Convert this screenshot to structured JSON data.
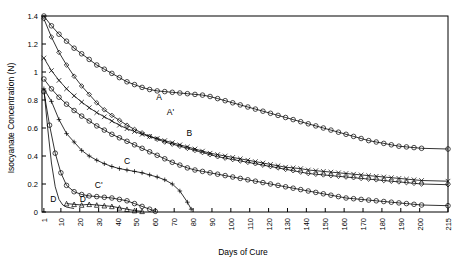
{
  "chart_data": {
    "type": "line",
    "title": "",
    "xlabel": "Days of Cure",
    "ylabel": "Isocyanate Concentration (N)",
    "xlim": [
      0,
      215
    ],
    "ylim": [
      0,
      1.4
    ],
    "grid": false,
    "legend_position": "inline-annotations",
    "x_ticks": [
      "1",
      "10",
      "20",
      "30",
      "40",
      "50",
      "60",
      "70",
      "80",
      "90",
      "100",
      "110",
      "120",
      "130",
      "140",
      "150",
      "160",
      "170",
      "180",
      "190",
      "200",
      "215"
    ],
    "y_ticks": [
      "0",
      "0.2",
      "0.4",
      "0.6",
      "0.8",
      "1",
      "1.2",
      "1.4"
    ],
    "annotations": [
      {
        "text": "A",
        "x": 62,
        "y": 0.8
      },
      {
        "text": "A'",
        "x": 68,
        "y": 0.695
      },
      {
        "text": "B",
        "x": 78,
        "y": 0.545
      },
      {
        "text": "C",
        "x": 45,
        "y": 0.345
      },
      {
        "text": "C'",
        "x": 30,
        "y": 0.175
      },
      {
        "text": "D",
        "x": 6,
        "y": 0.075
      },
      {
        "text": "D'",
        "x": 22,
        "y": 0.075
      }
    ],
    "series": [
      {
        "name": "A",
        "marker": "circle-open",
        "points": [
          [
            1,
            1.4
          ],
          [
            5,
            1.33
          ],
          [
            9,
            1.27
          ],
          [
            13,
            1.22
          ],
          [
            17,
            1.17
          ],
          [
            21,
            1.13
          ],
          [
            25,
            1.09
          ],
          [
            29,
            1.05
          ],
          [
            33,
            1.02
          ],
          [
            37,
            0.99
          ],
          [
            41,
            0.96
          ],
          [
            45,
            0.93
          ],
          [
            49,
            0.91
          ],
          [
            53,
            0.89
          ],
          [
            57,
            0.875
          ],
          [
            61,
            0.865
          ],
          [
            65,
            0.86
          ],
          [
            69,
            0.855
          ],
          [
            73,
            0.85
          ],
          [
            77,
            0.845
          ],
          [
            81,
            0.84
          ],
          [
            85,
            0.835
          ],
          [
            89,
            0.825
          ],
          [
            93,
            0.81
          ],
          [
            97,
            0.795
          ],
          [
            101,
            0.78
          ],
          [
            105,
            0.765
          ],
          [
            109,
            0.75
          ],
          [
            113,
            0.735
          ],
          [
            117,
            0.72
          ],
          [
            121,
            0.705
          ],
          [
            125,
            0.69
          ],
          [
            129,
            0.675
          ],
          [
            133,
            0.66
          ],
          [
            137,
            0.645
          ],
          [
            141,
            0.63
          ],
          [
            145,
            0.615
          ],
          [
            149,
            0.6
          ],
          [
            153,
            0.585
          ],
          [
            157,
            0.57
          ],
          [
            161,
            0.555
          ],
          [
            165,
            0.54
          ],
          [
            169,
            0.525
          ],
          [
            173,
            0.51
          ],
          [
            177,
            0.5
          ],
          [
            181,
            0.49
          ],
          [
            185,
            0.48
          ],
          [
            189,
            0.47
          ],
          [
            193,
            0.465
          ],
          [
            197,
            0.46
          ],
          [
            201,
            0.455
          ],
          [
            215,
            0.45
          ]
        ]
      },
      {
        "name": "A'",
        "marker": "diamond-open",
        "points": [
          [
            1,
            1.38
          ],
          [
            5,
            1.25
          ],
          [
            9,
            1.14
          ],
          [
            13,
            1.05
          ],
          [
            17,
            0.97
          ],
          [
            21,
            0.9
          ],
          [
            25,
            0.84
          ],
          [
            29,
            0.78
          ],
          [
            33,
            0.73
          ],
          [
            37,
            0.69
          ],
          [
            41,
            0.655
          ],
          [
            45,
            0.62
          ],
          [
            49,
            0.59
          ],
          [
            53,
            0.565
          ],
          [
            57,
            0.54
          ],
          [
            61,
            0.52
          ],
          [
            65,
            0.5
          ],
          [
            69,
            0.485
          ],
          [
            73,
            0.47
          ],
          [
            77,
            0.455
          ],
          [
            81,
            0.44
          ],
          [
            85,
            0.425
          ],
          [
            89,
            0.41
          ],
          [
            93,
            0.395
          ],
          [
            97,
            0.385
          ],
          [
            101,
            0.375
          ],
          [
            105,
            0.365
          ],
          [
            109,
            0.355
          ],
          [
            113,
            0.345
          ],
          [
            117,
            0.335
          ],
          [
            121,
            0.325
          ],
          [
            125,
            0.315
          ],
          [
            129,
            0.305
          ],
          [
            133,
            0.295
          ],
          [
            137,
            0.285
          ],
          [
            141,
            0.275
          ],
          [
            145,
            0.27
          ],
          [
            149,
            0.265
          ],
          [
            153,
            0.26
          ],
          [
            157,
            0.255
          ],
          [
            161,
            0.25
          ],
          [
            165,
            0.245
          ],
          [
            169,
            0.24
          ],
          [
            173,
            0.235
          ],
          [
            177,
            0.23
          ],
          [
            181,
            0.225
          ],
          [
            185,
            0.22
          ],
          [
            189,
            0.215
          ],
          [
            193,
            0.21
          ],
          [
            197,
            0.205
          ],
          [
            201,
            0.2
          ],
          [
            215,
            0.195
          ]
        ]
      },
      {
        "name": "B",
        "marker": "cross",
        "points": [
          [
            1,
            1.1
          ],
          [
            5,
            1.01
          ],
          [
            9,
            0.94
          ],
          [
            13,
            0.88
          ],
          [
            17,
            0.83
          ],
          [
            21,
            0.785
          ],
          [
            25,
            0.745
          ],
          [
            29,
            0.71
          ],
          [
            33,
            0.68
          ],
          [
            37,
            0.65
          ],
          [
            41,
            0.62
          ],
          [
            45,
            0.595
          ],
          [
            49,
            0.575
          ],
          [
            53,
            0.555
          ],
          [
            57,
            0.54
          ],
          [
            61,
            0.525
          ],
          [
            65,
            0.51
          ],
          [
            69,
            0.495
          ],
          [
            73,
            0.48
          ],
          [
            77,
            0.465
          ],
          [
            81,
            0.45
          ],
          [
            85,
            0.435
          ],
          [
            89,
            0.42
          ],
          [
            93,
            0.41
          ],
          [
            97,
            0.4
          ],
          [
            101,
            0.39
          ],
          [
            105,
            0.38
          ],
          [
            109,
            0.37
          ],
          [
            113,
            0.36
          ],
          [
            117,
            0.35
          ],
          [
            121,
            0.34
          ],
          [
            125,
            0.33
          ],
          [
            129,
            0.32
          ],
          [
            133,
            0.315
          ],
          [
            137,
            0.31
          ],
          [
            141,
            0.3
          ],
          [
            145,
            0.295
          ],
          [
            149,
            0.29
          ],
          [
            153,
            0.285
          ],
          [
            157,
            0.28
          ],
          [
            161,
            0.275
          ],
          [
            165,
            0.27
          ],
          [
            169,
            0.265
          ],
          [
            173,
            0.26
          ],
          [
            177,
            0.255
          ],
          [
            181,
            0.25
          ],
          [
            185,
            0.245
          ],
          [
            189,
            0.24
          ],
          [
            193,
            0.235
          ],
          [
            197,
            0.23
          ],
          [
            201,
            0.225
          ],
          [
            215,
            0.22
          ]
        ]
      },
      {
        "name": "B2",
        "marker": "circle-open",
        "points": [
          [
            1,
            0.95
          ],
          [
            5,
            0.88
          ],
          [
            9,
            0.82
          ],
          [
            13,
            0.77
          ],
          [
            17,
            0.725
          ],
          [
            21,
            0.685
          ],
          [
            25,
            0.65
          ],
          [
            29,
            0.615
          ],
          [
            33,
            0.585
          ],
          [
            37,
            0.555
          ],
          [
            41,
            0.53
          ],
          [
            45,
            0.505
          ],
          [
            49,
            0.48
          ],
          [
            53,
            0.455
          ],
          [
            57,
            0.43
          ],
          [
            61,
            0.405
          ],
          [
            65,
            0.38
          ],
          [
            69,
            0.355
          ],
          [
            73,
            0.335
          ],
          [
            77,
            0.315
          ],
          [
            81,
            0.3
          ],
          [
            85,
            0.29
          ],
          [
            89,
            0.28
          ],
          [
            93,
            0.27
          ],
          [
            97,
            0.26
          ],
          [
            101,
            0.25
          ],
          [
            105,
            0.24
          ],
          [
            109,
            0.23
          ],
          [
            113,
            0.22
          ],
          [
            117,
            0.21
          ],
          [
            121,
            0.2
          ],
          [
            125,
            0.19
          ],
          [
            129,
            0.18
          ],
          [
            133,
            0.17
          ],
          [
            137,
            0.16
          ],
          [
            141,
            0.15
          ],
          [
            145,
            0.14
          ],
          [
            149,
            0.13
          ],
          [
            153,
            0.12
          ],
          [
            157,
            0.11
          ],
          [
            161,
            0.1
          ],
          [
            165,
            0.095
          ],
          [
            169,
            0.09
          ],
          [
            173,
            0.085
          ],
          [
            177,
            0.08
          ],
          [
            181,
            0.075
          ],
          [
            185,
            0.07
          ],
          [
            189,
            0.065
          ],
          [
            193,
            0.06
          ],
          [
            197,
            0.055
          ],
          [
            201,
            0.05
          ],
          [
            215,
            0.045
          ]
        ]
      },
      {
        "name": "C",
        "marker": "plus",
        "points": [
          [
            1,
            0.88
          ],
          [
            5,
            0.79
          ],
          [
            9,
            0.66
          ],
          [
            13,
            0.56
          ],
          [
            17,
            0.5
          ],
          [
            21,
            0.44
          ],
          [
            25,
            0.4
          ],
          [
            29,
            0.37
          ],
          [
            33,
            0.345
          ],
          [
            37,
            0.325
          ],
          [
            41,
            0.31
          ],
          [
            45,
            0.3
          ],
          [
            49,
            0.29
          ],
          [
            53,
            0.28
          ],
          [
            57,
            0.265
          ],
          [
            61,
            0.25
          ],
          [
            65,
            0.23
          ],
          [
            69,
            0.2
          ],
          [
            73,
            0.15
          ],
          [
            77,
            0.07
          ],
          [
            79,
            0.02
          ]
        ]
      },
      {
        "name": "C'",
        "marker": "circle-open",
        "points": [
          [
            1,
            0.86
          ],
          [
            4,
            0.62
          ],
          [
            7,
            0.42
          ],
          [
            10,
            0.28
          ],
          [
            13,
            0.19
          ],
          [
            17,
            0.145
          ],
          [
            21,
            0.125
          ],
          [
            25,
            0.115
          ],
          [
            29,
            0.11
          ],
          [
            33,
            0.105
          ],
          [
            37,
            0.1
          ],
          [
            41,
            0.09
          ],
          [
            45,
            0.08
          ],
          [
            49,
            0.06
          ],
          [
            53,
            0.04
          ],
          [
            57,
            0.02
          ],
          [
            60,
            0.005
          ]
        ]
      },
      {
        "name": "D",
        "marker": "none",
        "points": [
          [
            1,
            0.88
          ],
          [
            3,
            0.6
          ],
          [
            5,
            0.35
          ],
          [
            7,
            0.18
          ],
          [
            9,
            0.09
          ],
          [
            11,
            0.05
          ],
          [
            13,
            0.035
          ],
          [
            15,
            0.03
          ],
          [
            17,
            0.025
          ]
        ]
      },
      {
        "name": "D'",
        "marker": "triangle-open",
        "points": [
          [
            13,
            0.06
          ],
          [
            17,
            0.055
          ],
          [
            21,
            0.05
          ],
          [
            25,
            0.055
          ],
          [
            29,
            0.05
          ],
          [
            33,
            0.045
          ],
          [
            37,
            0.04
          ],
          [
            41,
            0.03
          ],
          [
            45,
            0.02
          ],
          [
            49,
            0.01
          ],
          [
            53,
            0.005
          ]
        ]
      }
    ]
  }
}
